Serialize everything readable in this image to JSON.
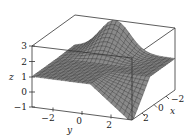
{
  "chart_data": {
    "type": "surface3d",
    "title": "",
    "xlabel": "x",
    "ylabel": "y",
    "zlabel": "z",
    "xlim": [
      -3,
      3
    ],
    "ylim": [
      -3,
      3
    ],
    "zlim": [
      -1,
      3
    ],
    "x_ticks": [
      -2,
      0,
      2
    ],
    "y_ticks": [
      -2,
      0,
      2
    ],
    "z_ticks": [
      -1,
      0,
      1,
      2,
      3
    ],
    "surface_description": "Saddle-like surface around plane z=1; ridge rising toward z≈3 near y≈-1..0 at back (x≈-3), dropping toward z≈-1 at front-right corner (x≈3, y≈3)",
    "grid": false,
    "box": true
  },
  "axes": {
    "z_label": "z",
    "y_label": "y",
    "x_label": "x",
    "z_tick_labels": [
      "3",
      "2",
      "1",
      "0",
      "−1"
    ],
    "y_tick_labels": [
      "−2",
      "0",
      "2"
    ],
    "x_tick_labels": [
      "−2",
      "0",
      "2"
    ]
  },
  "colors": {
    "mesh_line": "#2a2a2a",
    "mesh_fill": "#8a8a8a",
    "box": "#333333"
  }
}
